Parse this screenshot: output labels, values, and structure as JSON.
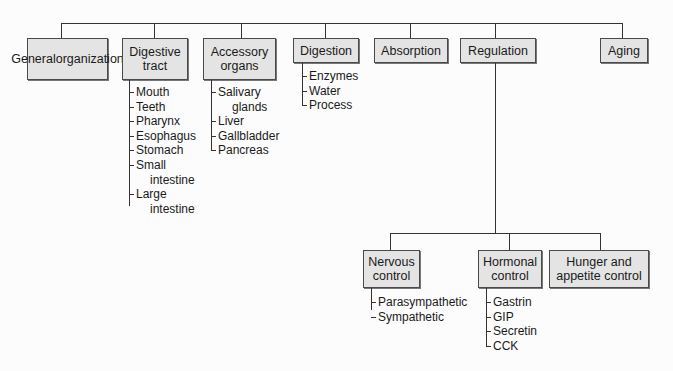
{
  "root": {
    "children": [
      {
        "label": "General organization",
        "lines": [
          "General",
          "organization"
        ],
        "items": []
      },
      {
        "label": "Digestive tract",
        "lines": [
          "Digestive",
          "tract"
        ],
        "items": [
          "Mouth",
          "Teeth",
          "Pharynx",
          "Esophagus",
          "Stomach",
          "Small intestine",
          "Large intestine"
        ]
      },
      {
        "label": "Accessory organs",
        "lines": [
          "Accessory",
          "organs"
        ],
        "items": [
          "Salivary glands",
          "Liver",
          "Gallbladder",
          "Pancreas"
        ]
      },
      {
        "label": "Digestion",
        "lines": [
          "Digestion"
        ],
        "items": [
          "Enzymes",
          "Water",
          "Process"
        ]
      },
      {
        "label": "Absorption",
        "lines": [
          "Absorption"
        ],
        "items": []
      },
      {
        "label": "Regulation",
        "lines": [
          "Regulation"
        ],
        "items": []
      },
      {
        "label": "Aging",
        "lines": [
          "Aging"
        ],
        "items": []
      }
    ]
  },
  "regulation": {
    "children": [
      {
        "label": "Nervous control",
        "lines": [
          "Nervous",
          "control"
        ],
        "items": [
          "Parasympathetic",
          "Sympathetic"
        ]
      },
      {
        "label": "Hormonal control",
        "lines": [
          "Hormonal",
          "control"
        ],
        "items": [
          "Gastrin",
          "GIP",
          "Secretin",
          "CCK"
        ]
      },
      {
        "label": "Hunger and appetite control",
        "lines": [
          "Hunger and",
          "appetite control"
        ],
        "items": []
      }
    ]
  },
  "lists": {
    "digestive_tract": [
      [
        "Mouth"
      ],
      [
        "Teeth"
      ],
      [
        "Pharynx"
      ],
      [
        "Esophagus"
      ],
      [
        "Stomach"
      ],
      [
        "Small",
        "intestine"
      ],
      [
        "Large",
        "intestine"
      ]
    ],
    "accessory_organs": [
      [
        "Salivary",
        "glands"
      ],
      [
        "Liver"
      ],
      [
        "Gallbladder"
      ],
      [
        "Pancreas"
      ]
    ]
  },
  "colors": {
    "box_fill": "#e4e4e4",
    "box_border": "#4a4a4a",
    "line": "#333333",
    "background": "#fcfcfc"
  }
}
